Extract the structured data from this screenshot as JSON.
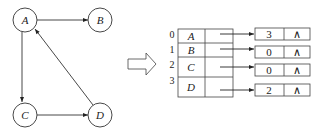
{
  "graph": {
    "nodes": [
      {
        "id": "A",
        "label": "A",
        "cx": 25,
        "cy": 20
      },
      {
        "id": "B",
        "label": "B",
        "cx": 100,
        "cy": 20
      },
      {
        "id": "C",
        "label": "C",
        "cx": 25,
        "cy": 115
      },
      {
        "id": "D",
        "label": "D",
        "cx": 100,
        "cy": 115
      }
    ],
    "edges": [
      {
        "from": "A",
        "to": "B"
      },
      {
        "from": "A",
        "to": "C"
      },
      {
        "from": "C",
        "to": "D"
      },
      {
        "from": "D",
        "to": "A"
      }
    ]
  },
  "transform_arrow": {
    "icon": "hollow-right-arrow-icon"
  },
  "adjacency_list": {
    "vertices": [
      {
        "index": "0",
        "label": "A",
        "edge_node": {
          "adjvex": "3",
          "next": "∧"
        }
      },
      {
        "index": "1",
        "label": "B",
        "edge_node": {
          "adjvex": "0",
          "next": "∧"
        }
      },
      {
        "index": "2",
        "label": "C",
        "edge_node": {
          "adjvex": "0",
          "next": "∧"
        }
      },
      {
        "index": "3",
        "label": "D",
        "edge_node": {
          "adjvex": "2",
          "next": "∧"
        }
      }
    ]
  }
}
